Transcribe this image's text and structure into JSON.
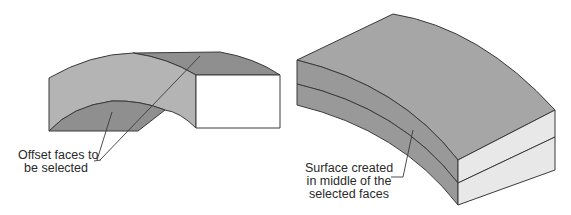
{
  "diagram": {
    "left_figure": {
      "description": "Curved solid with offset faces highlighted",
      "callout": {
        "lines": [
          "Offset faces to",
          "be selected"
        ]
      }
    },
    "right_figure": {
      "description": "Curved solid with mid-surface splitting the body",
      "callout": {
        "lines": [
          "Surface created",
          "in middle of the",
          "selected faces"
        ]
      }
    },
    "colors": {
      "background": "#ffffff",
      "face_light": "#b4b4b4",
      "face_dark": "#8f8f8f",
      "face_top": "#a6a6a6",
      "end_face": "#e8e8e8",
      "end_face_left": "#ffffff",
      "edge": "#3a3a3a",
      "leader": "#3a3a3a",
      "text": "#2a2a2a"
    }
  }
}
